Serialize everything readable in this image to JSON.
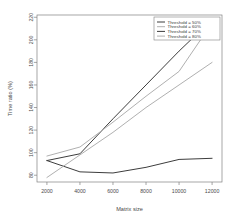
{
  "chart_data": {
    "type": "line",
    "title": "",
    "xlabel": "Matrix size",
    "ylabel": "Time ratio (%)",
    "x": [
      2000,
      4000,
      6000,
      8000,
      10000,
      12000
    ],
    "xticks": [
      "2000",
      "4000",
      "6000",
      "8000",
      "10000",
      "12000"
    ],
    "yticks": [
      "80",
      "100",
      "120",
      "140",
      "160",
      "180",
      "200",
      "220"
    ],
    "xlim": [
      1400,
      12600
    ],
    "ylim": [
      74,
      222
    ],
    "grid": false,
    "legend_position": "top-right",
    "series": [
      {
        "name": "Threshold = 50%",
        "color": "#3d3d3d",
        "values": [
          93,
          99,
          130,
          160,
          190,
          218
        ]
      },
      {
        "name": "Threshold = 60%",
        "color": "#b0b0b0",
        "values": [
          97,
          105,
          127,
          150,
          172,
          215
        ]
      },
      {
        "name": "Threshold = 70%",
        "color": "#3d3d3d",
        "values": [
          93,
          83,
          82,
          87,
          94,
          95
        ]
      },
      {
        "name": "Threshold = 80%",
        "color": "#b0b0b0",
        "values": [
          78,
          98,
          118,
          140,
          160,
          180
        ]
      }
    ]
  }
}
